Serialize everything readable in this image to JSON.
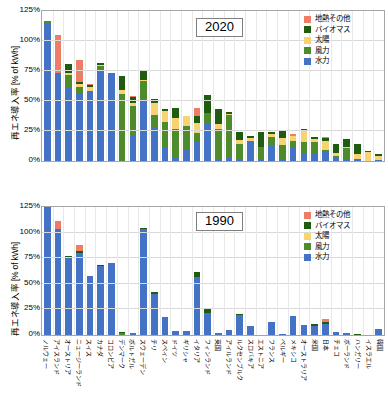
{
  "figure": {
    "ylabel": "再エネ導入率 [% of kWh]",
    "yticks": [
      "125%",
      "100%",
      "75%",
      "50%",
      "25%",
      "0%"
    ],
    "ymin": 0,
    "ymax": 125
  },
  "colors": {
    "geothermal_other": "#ED7D64",
    "biomass": "#1F5C10",
    "solar": "#F7D372",
    "wind": "#4E8C2B",
    "hydro": "#4472C4",
    "grid": "#D9D9D9",
    "axis": "#A6A6A6"
  },
  "legend": {
    "position": "top-right",
    "entries": [
      {
        "label": "地熱その他",
        "color_key": "geothermal_other",
        "swatch": "#ED7D64"
      },
      {
        "label": "バイオマス",
        "color_key": "biomass",
        "swatch": "#1F5C10"
      },
      {
        "label": "太陽",
        "color_key": "solar",
        "swatch": "#F7D372"
      },
      {
        "label": "風力",
        "color_key": "wind",
        "swatch": "#4E8C2B"
      },
      {
        "label": "水力",
        "color_key": "hydro",
        "swatch": "#4472C4"
      }
    ]
  },
  "panels": [
    {
      "id": "2020",
      "year_label": "2020"
    },
    {
      "id": "1990",
      "year_label": "1990"
    }
  ],
  "chart_data": [
    {
      "type": "bar",
      "title": "2020",
      "stacked": true,
      "xlabel": "",
      "ylabel": "再エネ導入率 [% of kWh]",
      "ylim": [
        0,
        125
      ],
      "yticks": [
        0,
        25,
        50,
        75,
        100,
        125
      ],
      "grid": true,
      "legend_position": "top-right",
      "categories": [
        "ノルウェー",
        "アイスランド",
        "オーストリア",
        "ニュージーランド",
        "スイス",
        "カナダ",
        "コロンビア",
        "デンマーク",
        "ポルトガル",
        "スウェーデン",
        "チリ",
        "スペイン",
        "ドイツ",
        "ギリシャ",
        "イタリア",
        "フィンランド",
        "英国",
        "アイルランド",
        "ルクセンブルク",
        "スロバキア",
        "エストニア",
        "フランス",
        "ベルギー",
        "メキシコ",
        "オーストラリア",
        "米国",
        "日本",
        "チェコ",
        "ポーランド",
        "ハンガリー",
        "イスラエル",
        "韓国"
      ],
      "series": [
        {
          "name": "水力",
          "values": [
            115.0,
            72.5,
            61.5,
            56.5,
            58.0,
            74.0,
            73.0,
            0.2,
            20.5,
            50.0,
            28.0,
            11.0,
            3.5,
            9.5,
            17.0,
            30.5,
            2.0,
            2.5,
            2.0,
            16.5,
            0.5,
            12.5,
            1.0,
            11.0,
            6.5,
            7.0,
            8.0,
            3.5,
            1.5,
            0.5,
            0.1,
            0.6
          ]
        },
        {
          "name": "風力",
          "values": [
            1.5,
            0.5,
            10.0,
            5.5,
            0.2,
            5.5,
            0.1,
            56.0,
            25.0,
            17.0,
            10.0,
            21.5,
            23.5,
            20.0,
            6.5,
            9.5,
            24.5,
            36.0,
            12.5,
            0.3,
            11.5,
            7.5,
            12.5,
            5.5,
            9.5,
            8.5,
            0.9,
            0.7,
            9.5,
            1.0,
            0.1,
            0.5
          ]
        },
        {
          "name": "太陽",
          "values": [
            0.0,
            0.0,
            2.0,
            2.5,
            3.5,
            0.7,
            0.1,
            3.0,
            2.5,
            0.7,
            10.0,
            9.0,
            8.5,
            8.0,
            8.5,
            0.3,
            4.0,
            0.9,
            3.0,
            2.0,
            0.1,
            2.5,
            5.5,
            4.0,
            9.0,
            3.0,
            7.5,
            2.5,
            0.6,
            4.0,
            7.5,
            3.5
          ]
        },
        {
          "name": "バイオマス",
          "values": [
            0.3,
            0.0,
            7.5,
            1.5,
            2.0,
            1.5,
            0.5,
            12.0,
            5.5,
            8.0,
            3.5,
            2.0,
            8.5,
            0.4,
            5.5,
            14.5,
            12.5,
            1.5,
            6.5,
            2.0,
            12.5,
            1.5,
            6.5,
            0.6,
            1.5,
            1.5,
            3.0,
            7.5,
            6.5,
            8.5,
            0.3,
            1.0
          ]
        },
        {
          "name": "地熱その他",
          "values": [
            0.0,
            32.0,
            0.0,
            18.5,
            0.4,
            0.0,
            0.0,
            0.0,
            0.5,
            0.0,
            0.5,
            0.0,
            0.0,
            0.0,
            6.5,
            0.0,
            0.0,
            0.0,
            0.5,
            0.0,
            0.0,
            0.0,
            0.4,
            1.5,
            0.0,
            0.4,
            0.3,
            0.2,
            0.2,
            0.2,
            0.0,
            0.2
          ]
        }
      ]
    },
    {
      "type": "bar",
      "title": "1990",
      "stacked": true,
      "xlabel": "",
      "ylabel": "再エネ導入率 [% of kWh]",
      "ylim": [
        0,
        125
      ],
      "yticks": [
        0,
        25,
        50,
        75,
        100,
        125
      ],
      "grid": true,
      "legend_position": "top-right",
      "categories": [
        "ノルウェー",
        "アイスランド",
        "オーストリア",
        "ニュージーランド",
        "スイス",
        "カナダ",
        "コロンビア",
        "デンマーク",
        "ポルトガル",
        "スウェーデン",
        "チリ",
        "スペイン",
        "ドイツ",
        "ギリシャ",
        "イタリア",
        "フィンランド",
        "英国",
        "アイルランド",
        "ルクセンブルク",
        "スロバキア",
        "エストニア",
        "フランス",
        "ベルギー",
        "メキシコ",
        "オーストラリア",
        "米国",
        "日本",
        "チェコ",
        "ポーランド",
        "ハンガリー",
        "イスラエル",
        "韓国"
      ],
      "series": [
        {
          "name": "水力",
          "values": [
            125.0,
            104.0,
            75.0,
            80.0,
            57.5,
            67.5,
            70.0,
            0.1,
            2.0,
            103.0,
            40.0,
            17.0,
            3.5,
            4.0,
            57.0,
            21.5,
            2.0,
            4.5,
            20.0,
            8.5,
            0.2,
            12.5,
            0.7,
            18.5,
            9.5,
            8.5,
            11.0,
            2.5,
            1.5,
            0.5,
            0.0,
            5.5
          ]
        },
        {
          "name": "風力",
          "values": [
            0.0,
            0.0,
            0.5,
            0.2,
            0.0,
            0.0,
            0.0,
            2.0,
            0.0,
            0.5,
            0.0,
            0.3,
            0.1,
            0.1,
            0.0,
            0.0,
            0.0,
            0.5,
            0.0,
            0.0,
            0.0,
            0.1,
            0.1,
            0.1,
            0.0,
            0.5,
            0.0,
            0.0,
            0.0,
            0.0,
            0.0,
            0.0
          ]
        },
        {
          "name": "太陽",
          "values": [
            0.0,
            0.0,
            0.0,
            0.0,
            0.0,
            0.0,
            0.0,
            0.0,
            0.0,
            0.0,
            0.0,
            0.0,
            0.0,
            0.0,
            0.0,
            0.0,
            0.0,
            0.0,
            0.0,
            0.0,
            0.0,
            0.0,
            0.0,
            0.0,
            0.0,
            0.0,
            0.0,
            0.0,
            0.0,
            0.0,
            0.0,
            0.0
          ]
        },
        {
          "name": "バイオマス",
          "values": [
            0.3,
            0.0,
            1.5,
            2.0,
            0.5,
            0.5,
            0.0,
            0.8,
            0.0,
            1.5,
            2.0,
            0.3,
            0.5,
            0.0,
            4.5,
            5.0,
            0.2,
            0.1,
            0.5,
            0.0,
            0.1,
            0.4,
            0.5,
            0.3,
            0.3,
            1.5,
            2.0,
            0.3,
            0.2,
            0.3,
            0.0,
            0.2
          ]
        },
        {
          "name": "地熱その他",
          "values": [
            0.0,
            7.5,
            0.0,
            6.0,
            0.0,
            0.0,
            0.0,
            0.0,
            0.0,
            0.0,
            0.0,
            0.0,
            0.0,
            0.0,
            0.0,
            0.0,
            0.0,
            0.0,
            0.0,
            0.0,
            0.0,
            0.0,
            0.0,
            0.0,
            0.0,
            0.0,
            3.0,
            0.0,
            0.0,
            0.0,
            0.0,
            0.0
          ]
        }
      ]
    }
  ]
}
